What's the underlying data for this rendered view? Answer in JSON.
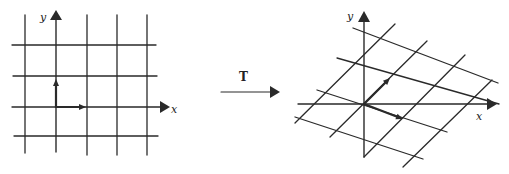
{
  "diagram": {
    "stroke_color": "#2a2a2a",
    "background": "#ffffff",
    "left_panel": {
      "name": "original-grid",
      "x_label": "x",
      "y_label": "y",
      "x_label_pos": [
        171,
        104
      ],
      "y_label_pos": [
        40,
        12
      ],
      "grid_lines": [
        [
          25,
          15,
          25,
          153
        ],
        [
          87,
          15,
          87,
          155
        ],
        [
          117,
          15,
          117,
          155
        ],
        [
          147,
          15,
          147,
          155
        ],
        [
          12,
          45,
          156,
          45
        ],
        [
          13,
          76,
          157,
          76
        ],
        [
          14,
          136,
          158,
          136
        ]
      ],
      "x_axis": [
        12,
        107,
        160,
        107
      ],
      "x_arrow": [
        [
          160,
          101
        ],
        [
          170,
          107
        ],
        [
          160,
          113
        ]
      ],
      "y_axis": [
        56,
        152,
        56,
        20
      ],
      "y_arrow": [
        [
          50,
          20
        ],
        [
          56,
          10
        ],
        [
          62,
          20
        ]
      ],
      "basis_vectors": [
        {
          "name": "e1",
          "from": [
            56,
            107
          ],
          "to": [
            86,
            107
          ]
        },
        {
          "name": "e2",
          "from": [
            56,
            107
          ],
          "to": [
            56,
            79
          ]
        }
      ]
    },
    "transform_arrow": {
      "label": "T",
      "label_pos": [
        239,
        71
      ],
      "line": [
        221,
        92,
        271,
        92
      ],
      "head": [
        [
          270,
          86
        ],
        [
          280,
          92
        ],
        [
          270,
          98
        ]
      ]
    },
    "right_panel": {
      "name": "transformed-grid",
      "x_label": "x",
      "y_label": "y",
      "x_label_pos": [
        476,
        111
      ],
      "y_label_pos": [
        347,
        11
      ],
      "grid_lines": [
        [
          295,
          123,
          395,
          24
        ],
        [
          330,
          137,
          427,
          41
        ],
        [
          364,
          157,
          465,
          55
        ],
        [
          403,
          167,
          492,
          80
        ],
        [
          353,
          28,
          498,
          83
        ],
        [
          337,
          58,
          499,
          104
        ],
        [
          317,
          90,
          447,
          132
        ],
        [
          295,
          117,
          423,
          159
        ]
      ],
      "x_axis": [
        298,
        104,
        487,
        104
      ],
      "x_arrow": [
        [
          487,
          98
        ],
        [
          497,
          104
        ],
        [
          487,
          110
        ]
      ],
      "y_axis": [
        364,
        157,
        364,
        22
      ],
      "y_arrow": [
        [
          358,
          22
        ],
        [
          364,
          11
        ],
        [
          370,
          22
        ]
      ],
      "basis_vectors": [
        {
          "name": "Te1",
          "from": [
            364,
            104
          ],
          "to": [
            403,
            119
          ]
        },
        {
          "name": "Te2",
          "from": [
            364,
            104
          ],
          "to": [
            390,
            78
          ]
        }
      ]
    }
  }
}
